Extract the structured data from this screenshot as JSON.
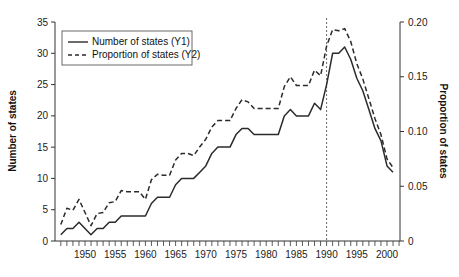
{
  "chart_data": {
    "type": "line",
    "title": "",
    "xlabel": "",
    "ylabel": "Number of states",
    "y2label": "Proportion of states",
    "xlim": [
      1945,
      2002
    ],
    "ylim": [
      0,
      35
    ],
    "y2lim": [
      0,
      0.2
    ],
    "xticks": [
      1950,
      1955,
      1960,
      1965,
      1970,
      1975,
      1980,
      1985,
      1990,
      1995,
      2000
    ],
    "yticks": [
      0,
      5,
      10,
      15,
      20,
      25,
      30,
      35
    ],
    "y2ticks": [
      "0",
      "0.05",
      "0.10",
      "0.15",
      "0.20"
    ],
    "reference_line_x": 1990,
    "legend": {
      "position": "upper-left",
      "entries": [
        "Number of states (Y1)",
        "Proportion of states (Y2)"
      ]
    },
    "x": [
      1946,
      1947,
      1948,
      1949,
      1950,
      1951,
      1952,
      1953,
      1954,
      1955,
      1956,
      1957,
      1958,
      1959,
      1960,
      1961,
      1962,
      1963,
      1964,
      1965,
      1966,
      1967,
      1968,
      1969,
      1970,
      1971,
      1972,
      1973,
      1974,
      1975,
      1976,
      1977,
      1978,
      1979,
      1980,
      1981,
      1982,
      1983,
      1984,
      1985,
      1986,
      1987,
      1988,
      1989,
      1990,
      1991,
      1992,
      1993,
      1994,
      1995,
      1996,
      1997,
      1998,
      1999,
      2000,
      2001
    ],
    "series": [
      {
        "name": "Number of states (Y1)",
        "axis": "Y1",
        "style": "solid",
        "values": [
          1,
          2,
          2,
          3,
          2,
          1,
          2,
          2,
          3,
          3,
          4,
          4,
          4,
          4,
          4,
          6,
          7,
          7,
          7,
          9,
          10,
          10,
          10,
          11,
          12,
          14,
          15,
          15,
          15,
          17,
          18,
          18,
          17,
          17,
          17,
          17,
          17,
          20,
          21,
          20,
          20,
          20,
          22,
          21,
          25,
          30,
          30,
          31,
          29,
          26,
          24,
          21,
          18,
          16,
          12,
          11
        ]
      },
      {
        "name": "Proportion of states (Y2)",
        "axis": "Y2",
        "style": "dashed",
        "values": [
          0.015,
          0.03,
          0.028,
          0.038,
          0.026,
          0.014,
          0.025,
          0.026,
          0.035,
          0.036,
          0.046,
          0.045,
          0.045,
          0.045,
          0.038,
          0.056,
          0.061,
          0.06,
          0.06,
          0.074,
          0.08,
          0.08,
          0.078,
          0.086,
          0.093,
          0.104,
          0.11,
          0.11,
          0.11,
          0.121,
          0.129,
          0.127,
          0.121,
          0.121,
          0.121,
          0.121,
          0.121,
          0.141,
          0.15,
          0.142,
          0.142,
          0.142,
          0.156,
          0.151,
          0.178,
          0.193,
          0.192,
          0.194,
          0.182,
          0.162,
          0.148,
          0.13,
          0.112,
          0.097,
          0.075,
          0.067
        ]
      }
    ]
  },
  "axes": {
    "left_title": "Number of states",
    "right_title": "Proportion of states"
  },
  "legend": {
    "solid_label": "Number of states (Y1)",
    "dashed_label": "Proportion of states (Y2)"
  },
  "colors": {
    "line": "#2b2b2b",
    "axis": "#333333",
    "background": "#ffffff"
  }
}
